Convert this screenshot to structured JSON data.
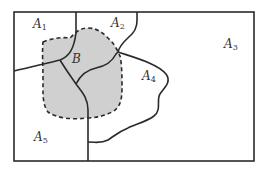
{
  "diagram": {
    "type": "region-partition",
    "colors": {
      "line": "#2a2a2a",
      "shade": "#d0d0d0",
      "background": "#ffffff"
    },
    "regions": [
      {
        "id": "A1",
        "letter": "A",
        "sub": "1"
      },
      {
        "id": "A2",
        "letter": "A",
        "sub": "2"
      },
      {
        "id": "A3",
        "letter": "A",
        "sub": "3"
      },
      {
        "id": "A4",
        "letter": "A",
        "sub": "4"
      },
      {
        "id": "A5",
        "letter": "A",
        "sub": "5"
      }
    ],
    "set": {
      "id": "B",
      "letter": "B",
      "style": "shaded, dashed boundary"
    }
  }
}
